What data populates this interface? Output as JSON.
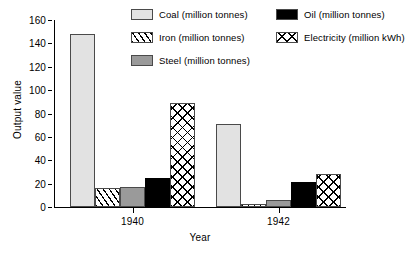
{
  "chart_data": {
    "type": "bar",
    "title": "",
    "xlabel": "Year",
    "ylabel": "Output value",
    "categories": [
      "1940",
      "1942"
    ],
    "ylim": [
      0,
      160
    ],
    "yticks": [
      0,
      20,
      40,
      60,
      80,
      100,
      120,
      140,
      160
    ],
    "grid": false,
    "legend_position": "top-right",
    "series": [
      {
        "name": "Coal (million tonnes)",
        "short": "Coal",
        "pattern": "solid-light-gray",
        "color": "#e2e2e2",
        "values": [
          148,
          71
        ]
      },
      {
        "name": "Iron (million tonnes)",
        "short": "Iron",
        "pattern": "diagonal-hatch",
        "color": "#ffffff",
        "values": [
          16,
          3
        ]
      },
      {
        "name": "Steel (million tonnes)",
        "short": "Steel",
        "pattern": "solid-mid-gray",
        "color": "#9a9a9a",
        "values": [
          17.5,
          6
        ]
      },
      {
        "name": "Oil (million tonnes)",
        "short": "Oil",
        "pattern": "solid-black",
        "color": "#000000",
        "values": [
          25,
          21
        ]
      },
      {
        "name": "Electricity (million kWh)",
        "short": "Electricity",
        "pattern": "cross-hatch",
        "color": "#ffffff",
        "values": [
          89,
          28
        ]
      }
    ]
  },
  "legend": {
    "items": [
      {
        "label": "Coal (million tonnes)"
      },
      {
        "label": "Iron (million tonnes)"
      },
      {
        "label": "Steel (million tonnes)"
      },
      {
        "label": "Oil (million tonnes)"
      },
      {
        "label": "Electricity (million kWh)"
      }
    ]
  },
  "axes": {
    "y_title": "Output value",
    "x_title": "Year",
    "y_tick_labels": [
      "0",
      "20",
      "40",
      "60",
      "80",
      "100",
      "120",
      "140",
      "160"
    ],
    "x_tick_labels": [
      "1940",
      "1942"
    ]
  }
}
